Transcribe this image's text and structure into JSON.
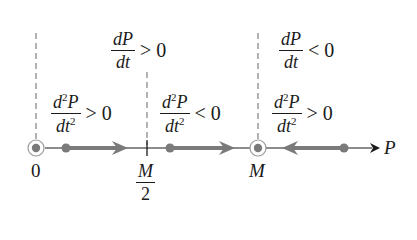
{
  "diagram": {
    "type": "phase-line",
    "axis_label": "P",
    "points": [
      {
        "label": "0",
        "kind": "equilibrium"
      },
      {
        "label_num": "M",
        "label_den": "2",
        "kind": "inflection"
      },
      {
        "label": "M",
        "kind": "equilibrium"
      }
    ],
    "regions": [
      {
        "first_derivative": {
          "num": "dP",
          "den": "dt",
          "relation": "> 0"
        }
      },
      {
        "first_derivative": {
          "num": "dP",
          "den": "dt",
          "relation": "< 0"
        }
      }
    ],
    "second_derivative_labels": [
      {
        "num_d": "d",
        "num_exp": "2",
        "num_var": "P",
        "den_var": "dt",
        "den_exp": "2",
        "relation": "> 0"
      },
      {
        "num_d": "d",
        "num_exp": "2",
        "num_var": "P",
        "den_var": "dt",
        "den_exp": "2",
        "relation": "< 0"
      },
      {
        "num_d": "d",
        "num_exp": "2",
        "num_var": "P",
        "den_var": "dt",
        "den_exp": "2",
        "relation": "> 0"
      }
    ],
    "flow_directions": [
      "right",
      "right",
      "left"
    ],
    "colors": {
      "line": "#1a1a1a",
      "flow": "#7a7a7a",
      "dashed": "#8a8a8a"
    }
  }
}
